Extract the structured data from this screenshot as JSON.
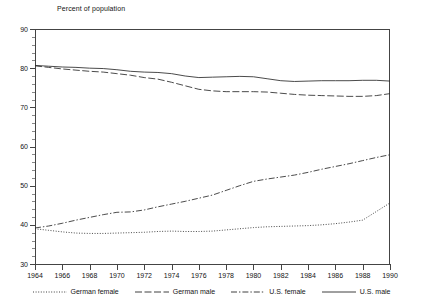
{
  "chart_data": {
    "type": "line",
    "title": "Percent of population",
    "xlabel": "",
    "ylabel": "Percent of population",
    "xlim": [
      1964,
      1990
    ],
    "ylim": [
      30,
      90
    ],
    "ytick_step": 10,
    "xtick_step": 2,
    "grid": false,
    "legend_position": "bottom",
    "ytick_labels": [
      "90",
      "80",
      "70",
      "60",
      "50",
      "40",
      "30"
    ],
    "xtick_labels": [
      "1964",
      "1966",
      "1968",
      "1970",
      "1972",
      "1974",
      "1976",
      "1978",
      "1980",
      "1982",
      "1984",
      "1986",
      "1988",
      "1990"
    ],
    "x": [
      1964,
      1965,
      1966,
      1967,
      1968,
      1969,
      1970,
      1971,
      1972,
      1973,
      1974,
      1975,
      1976,
      1977,
      1978,
      1979,
      1980,
      1981,
      1982,
      1983,
      1984,
      1985,
      1986,
      1987,
      1988,
      1989,
      1990
    ],
    "series": [
      {
        "name": "German female",
        "style": "dotted",
        "values": [
          39.0,
          38.6,
          38.2,
          37.9,
          37.8,
          37.8,
          37.9,
          38.0,
          38.1,
          38.3,
          38.4,
          38.3,
          38.3,
          38.4,
          38.7,
          39.0,
          39.3,
          39.5,
          39.6,
          39.7,
          39.8,
          40.0,
          40.3,
          40.7,
          41.2,
          43.4,
          45.6
        ]
      },
      {
        "name": "German male",
        "style": "dashed",
        "values": [
          80.6,
          80.2,
          79.8,
          79.5,
          79.2,
          79.0,
          78.6,
          78.2,
          77.6,
          77.2,
          76.4,
          75.5,
          74.6,
          74.2,
          74.0,
          74.0,
          74.0,
          73.9,
          73.6,
          73.3,
          73.1,
          73.0,
          72.9,
          72.8,
          72.8,
          73.0,
          73.5
        ]
      },
      {
        "name": "U.S. female",
        "style": "dashdot",
        "values": [
          39.2,
          39.7,
          40.4,
          41.2,
          41.9,
          42.6,
          43.2,
          43.3,
          43.8,
          44.6,
          45.3,
          46.0,
          46.8,
          47.6,
          48.8,
          50.0,
          51.1,
          51.7,
          52.2,
          52.7,
          53.4,
          54.2,
          54.9,
          55.6,
          56.4,
          57.2,
          57.9
        ]
      },
      {
        "name": "U.S. male",
        "style": "solid",
        "values": [
          80.7,
          80.5,
          80.3,
          80.2,
          80.0,
          79.9,
          79.6,
          79.2,
          79.0,
          78.9,
          78.6,
          78.0,
          77.6,
          77.7,
          77.8,
          77.9,
          77.8,
          77.3,
          76.8,
          76.6,
          76.7,
          76.8,
          76.8,
          76.8,
          76.9,
          76.9,
          76.7
        ]
      }
    ]
  }
}
